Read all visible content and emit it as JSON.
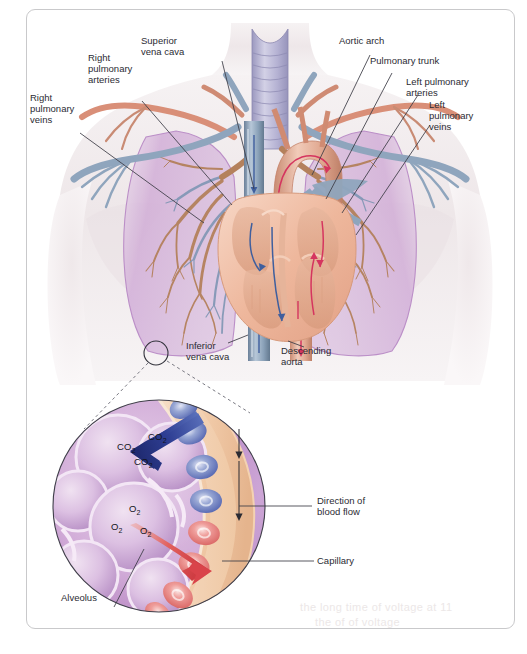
{
  "figure": {
    "border_color": "#c9c9cb",
    "background": "#ffffff"
  },
  "colors": {
    "lung": "#c9a4cf",
    "lung_light": "#d9bcdd",
    "body": "#f0ebec",
    "artery_red": "#d98f78",
    "vein_blue": "#8fa5bd",
    "heart_muscle": "#f2c3ae",
    "trachea": "#b9b6d6",
    "arrow_blue": "#3a4b9c",
    "arrow_red": "#e1504f",
    "flow_red": "#d5355f",
    "flow_blue": "#3f5f9e",
    "capillary_wall": "#f0cbab",
    "rbc_blue": "#6f7fc0",
    "rbc_red": "#e87f80",
    "leader_line": "#3b3b45",
    "text": "#2b2b33"
  },
  "labels": {
    "right_pulmonary_veins": "Right\npulmonary\nveins",
    "right_pulmonary_arteries": "Right\npulmonary\narteries",
    "superior_vena_cava": "Superior\nvena cava",
    "aortic_arch": "Aortic arch",
    "pulmonary_trunk": "Pulmonary trunk",
    "left_pulmonary_arteries": "Left pulmonary\narteries",
    "left_pulmonary_veins": "Left\npulmonary\nveins",
    "inferior_vena_cava": "Inferior\nvena cava",
    "descending_aorta": "Descending\naorta",
    "direction_of_blood_flow": "Direction of\nblood flow",
    "capillary": "Capillary",
    "alveolus": "Alveolus"
  },
  "inset": {
    "name": "alveolar-gas-exchange-magnification",
    "gas_labels": [
      {
        "id": "co2-1",
        "formula": "CO",
        "sub": "2"
      },
      {
        "id": "co2-2",
        "formula": "CO",
        "sub": "2"
      },
      {
        "id": "co2-3",
        "formula": "CO",
        "sub": "2"
      },
      {
        "id": "o2-1",
        "formula": "O",
        "sub": "2"
      },
      {
        "id": "o2-2",
        "formula": "O",
        "sub": "2"
      },
      {
        "id": "o2-3",
        "formula": "O",
        "sub": "2"
      }
    ],
    "arrows": [
      {
        "id": "co2-diffusion-arrow",
        "direction": "blood-to-alveolus",
        "color": "#2c3e94"
      },
      {
        "id": "o2-diffusion-arrow",
        "direction": "alveolus-to-blood",
        "color": "#e0504f"
      }
    ]
  },
  "ghost_text": {
    "line1": "the long time of voltage at 11",
    "line2": "the of of voltage"
  }
}
